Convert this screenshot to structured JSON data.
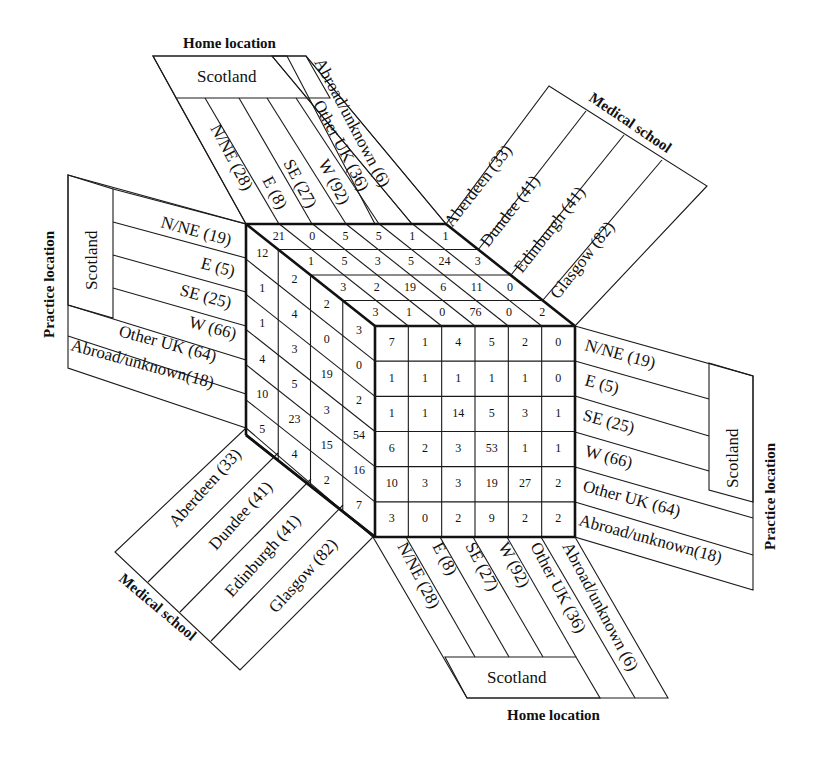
{
  "figure": {
    "titles": {
      "home_top": "Home location",
      "home_bottom": "Home location",
      "school_top": "Medical school",
      "school_bottom": "Medical school",
      "practice_left": "Practice location",
      "practice_right": "Practice location"
    },
    "group_label": "Scotland",
    "home_location": [
      "N/NE (28)",
      "E (8)",
      "SE (27)",
      "W (92)",
      "Other UK (36)",
      "Abroad/unknown (6)"
    ],
    "medical_school": [
      "Aberdeen (33)",
      "Dundee (41)",
      "Edinburgh (41)",
      "Glasgow (82)"
    ],
    "practice_location": [
      "N/NE (19)",
      "E (5)",
      "SE (25)",
      "W (66)",
      "Other UK (64)",
      "Abroad/unknown(18)"
    ]
  },
  "cube": {
    "top_face": {
      "note": "Rows = medical school (Aberdeen, Dundee, Edinburgh, Glasgow), columns = home location",
      "rows": [
        [
          21,
          0,
          5,
          5,
          1,
          1
        ],
        [
          1,
          5,
          3,
          5,
          24,
          3
        ],
        [
          3,
          2,
          19,
          6,
          11,
          0
        ],
        [
          3,
          1,
          0,
          76,
          0,
          2
        ]
      ]
    },
    "left_face": {
      "note": "Columns = medical school (Aberdeen, Dundee, Edinburgh, Glasgow), rows = practice location",
      "columns": [
        [
          12,
          1,
          1,
          4,
          10,
          5
        ],
        [
          2,
          4,
          3,
          5,
          23,
          4
        ],
        [
          2,
          0,
          19,
          3,
          15,
          2
        ],
        [
          3,
          0,
          2,
          54,
          16,
          7
        ]
      ]
    },
    "front_face": {
      "note": "Rows = practice location, columns = home location",
      "rows": [
        [
          7,
          1,
          4,
          5,
          2,
          0
        ],
        [
          1,
          1,
          1,
          1,
          1,
          0
        ],
        [
          1,
          1,
          14,
          5,
          3,
          1
        ],
        [
          6,
          2,
          3,
          53,
          1,
          1
        ],
        [
          10,
          3,
          3,
          19,
          27,
          2
        ],
        [
          3,
          0,
          2,
          9,
          2,
          2
        ]
      ]
    }
  }
}
